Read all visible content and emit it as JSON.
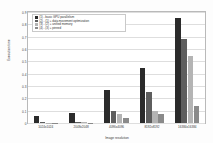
{
  "chart_data": {
    "type": "bar",
    "title": "",
    "xlabel": "Image resolution",
    "ylabel": "Execution time",
    "ylim": [
      0,
      0.9
    ],
    "yticks": [
      "0",
      "0.1",
      "0.2",
      "0.3",
      "0.4",
      "0.5",
      "0.6",
      "0.7",
      "0.8",
      "0.9"
    ],
    "grid": true,
    "legend_position": "top-left",
    "categories": [
      "1024x1024",
      "2048x2048",
      "4096x4096",
      "8192x8192",
      "16384x16384"
    ],
    "series": [
      {
        "name": "(1) - basic GPU parallelism",
        "color": "#2b2b2b",
        "values": [
          0.06,
          0.08,
          0.27,
          0.45,
          0.85
        ]
      },
      {
        "name": "(2) - (1) + data movement optimization",
        "color": "#5e5e5e",
        "values": [
          0.005,
          0.006,
          0.1,
          0.25,
          0.68
        ]
      },
      {
        "name": "(3) - (2) + unified memory",
        "color": "#b4b4b4",
        "values": [
          0.004,
          0.005,
          0.07,
          0.1,
          0.54
        ]
      },
      {
        "name": "(4) - (3) + pinned",
        "color": "#8a8a8a",
        "values": [
          0.003,
          0.004,
          0.04,
          0.07,
          0.14
        ]
      }
    ]
  }
}
